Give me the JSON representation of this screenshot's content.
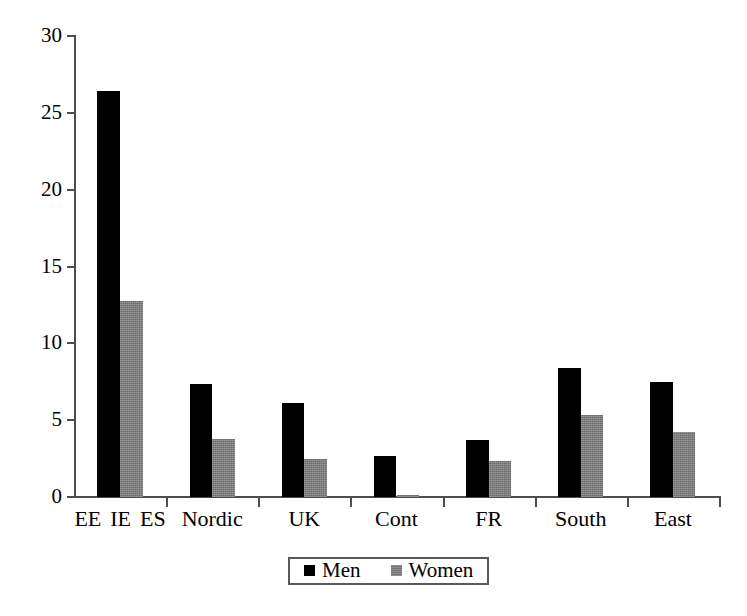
{
  "chart_data": {
    "type": "bar",
    "title": "",
    "subtitle": "",
    "xlabel": "",
    "ylabel": "",
    "ylim": [
      0,
      30
    ],
    "yticks": [
      0,
      5,
      10,
      15,
      20,
      25,
      30
    ],
    "ytick_labels": [
      "0",
      "5",
      "10",
      "15",
      "20",
      "25",
      "30"
    ],
    "grid": false,
    "legend_position": "bottom-center",
    "categories": [
      "EE IE ES",
      "Nordic",
      "UK",
      "Cont",
      "FR",
      "South",
      "East"
    ],
    "category_sublabels": [
      [
        "EE",
        "IE",
        "ES"
      ],
      [
        "Nordic"
      ],
      [
        "UK"
      ],
      [
        "Cont"
      ],
      [
        "FR"
      ],
      [
        "South"
      ],
      [
        "East"
      ]
    ],
    "series": [
      {
        "name": "Men",
        "color": "#000000",
        "values": [
          26.4,
          7.35,
          6.15,
          2.7,
          3.7,
          8.4,
          7.5
        ]
      },
      {
        "name": "Women",
        "color": "#818181",
        "values": [
          12.75,
          3.75,
          2.5,
          0.15,
          2.35,
          5.35,
          4.2
        ]
      }
    ]
  },
  "legend": {
    "items": [
      {
        "label": "Men",
        "swatch": "men"
      },
      {
        "label": "Women",
        "swatch": "women"
      }
    ]
  },
  "axis": {
    "y_axis_name": "y-axis",
    "x_axis_name": "x-axis"
  },
  "colors": {
    "men": "#000000",
    "women": "#818181",
    "axis": "#4d4d4d",
    "background": "#ffffff"
  }
}
